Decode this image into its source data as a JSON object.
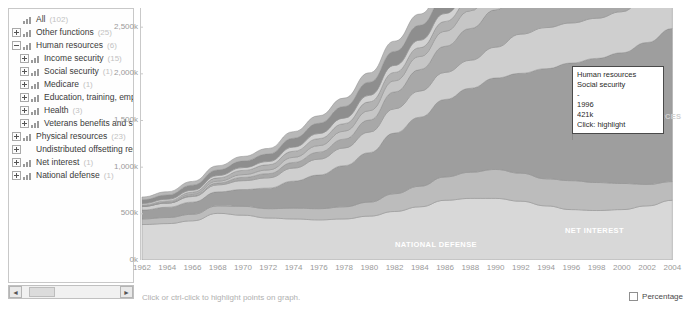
{
  "sidebar": {
    "items": [
      {
        "label": "All",
        "count": "(102)",
        "indent": 0,
        "expander": "none",
        "icon": "bar-chart-icon"
      },
      {
        "label": "Other functions",
        "count": "(25)",
        "indent": 0,
        "expander": "plus",
        "icon": "bar-chart-icon"
      },
      {
        "label": "Human resources",
        "count": "(6)",
        "indent": 0,
        "expander": "minus",
        "icon": "bar-chart-icon"
      },
      {
        "label": "Income security",
        "count": "(15)",
        "indent": 1,
        "expander": "plus",
        "icon": "bar-chart-icon"
      },
      {
        "label": "Social security",
        "count": "(1)",
        "indent": 1,
        "expander": "plus",
        "icon": "bar-chart-icon"
      },
      {
        "label": "Medicare",
        "count": "(1)",
        "indent": 1,
        "expander": "plus",
        "icon": "bar-chart-icon"
      },
      {
        "label": "Education, training, emp",
        "count": "",
        "indent": 1,
        "expander": "plus",
        "icon": "bar-chart-icon"
      },
      {
        "label": "Health",
        "count": "(3)",
        "indent": 1,
        "expander": "plus",
        "icon": "bar-chart-icon"
      },
      {
        "label": "Veterans benefits and s",
        "count": "",
        "indent": 1,
        "expander": "plus",
        "icon": "bar-chart-icon"
      },
      {
        "label": "Physical resources",
        "count": "(23)",
        "indent": 0,
        "expander": "plus",
        "icon": "bar-chart-icon"
      },
      {
        "label": "Undistributed offsetting rec",
        "count": "",
        "indent": 0,
        "expander": "plus",
        "icon": "none"
      },
      {
        "label": "Net interest",
        "count": "(1)",
        "indent": 0,
        "expander": "plus",
        "icon": "bar-chart-icon"
      },
      {
        "label": "National defense",
        "count": "(1)",
        "indent": 0,
        "expander": "plus",
        "icon": "bar-chart-icon"
      }
    ],
    "scroll": {
      "left_arrow": "◄",
      "right_arrow": "►"
    }
  },
  "tooltip": {
    "line1": "Human resources",
    "line2": "Social security",
    "line3": "-",
    "line4": "1996",
    "line5": "421k",
    "line6": "Click: highlight"
  },
  "footer": {
    "hint": "Click or ctrl-click to highlight points on graph.",
    "percentage_label": "Percentage"
  },
  "area_labels": {
    "national_defense": "NATIONAL DEFENSE",
    "net_interest": "NET INTEREST",
    "human_resources": "HUMAN RESOURCES"
  },
  "chart_data": {
    "type": "area",
    "title": "",
    "xlabel": "",
    "ylabel": "",
    "grid": false,
    "legend_position": "in-chart",
    "xlim": [
      1962,
      2005
    ],
    "ylim": [
      0,
      2700
    ],
    "y_unit": "k",
    "yticks": [
      0,
      500,
      1000,
      1500,
      2000,
      2500
    ],
    "ytick_labels": [
      "0k",
      "500k",
      "1,000k",
      "1,500k",
      "2,000k",
      "2,500k"
    ],
    "x": [
      1962,
      1964,
      1966,
      1968,
      1970,
      1972,
      1974,
      1976,
      1978,
      1980,
      1982,
      1984,
      1986,
      1988,
      1990,
      1992,
      1994,
      1996,
      1998,
      2000,
      2002,
      2004
    ],
    "xtick_labels": [
      "1962",
      "1964",
      "1966",
      "1968",
      "1970",
      "1972",
      "1974",
      "1976",
      "1978",
      "1980",
      "1982",
      "1984",
      "1986",
      "1988",
      "1990",
      "1992",
      "1994",
      "1996",
      "1998",
      "2000",
      "2002",
      "2004"
    ],
    "stacked": true,
    "series": [
      {
        "name": "National defense",
        "color": "#d8d8d8",
        "values": [
          380,
          390,
          420,
          500,
          480,
          450,
          440,
          430,
          440,
          470,
          520,
          570,
          640,
          660,
          660,
          630,
          580,
          540,
          530,
          540,
          580,
          640
        ]
      },
      {
        "name": "Net interest",
        "color": "#bcbcbc",
        "values": [
          60,
          65,
          70,
          80,
          95,
          100,
          115,
          120,
          130,
          150,
          190,
          220,
          250,
          280,
          310,
          300,
          290,
          310,
          300,
          280,
          230,
          200
        ]
      },
      {
        "name": "Human resources",
        "sublayers": [
          {
            "name": "Social security",
            "color": "#9e9e9e",
            "values": [
              95,
              110,
              130,
              150,
              180,
              220,
              290,
              360,
              440,
              530,
              650,
              740,
              830,
              900,
              980,
              1070,
              1180,
              1260,
              1330,
              1400,
              1520,
              1640
            ]
          },
          {
            "name": "Income security",
            "color": "#cfcfcf",
            "values": [
              40,
              45,
              60,
              75,
              95,
              110,
              140,
              170,
              190,
              220,
              260,
              280,
              290,
              300,
              330,
              420,
              440,
              430,
              430,
              440,
              510,
              560
            ]
          },
          {
            "name": "Medicare",
            "color": "#a8a8a8",
            "values": [
              0,
              0,
              10,
              20,
              35,
              45,
              60,
              75,
              95,
              130,
              180,
              230,
              280,
              340,
              400,
              480,
              560,
              600,
              620,
              680,
              760,
              840
            ]
          },
          {
            "name": "Health",
            "color": "#c6c6c6",
            "values": [
              5,
              8,
              12,
              20,
              30,
              40,
              55,
              70,
              85,
              100,
              120,
              140,
              160,
              190,
              230,
              290,
              330,
              360,
              380,
              430,
              500,
              570
            ]
          },
          {
            "name": "Education, training, employment",
            "color": "#b2b2b2",
            "values": [
              10,
              15,
              25,
              35,
              45,
              55,
              65,
              75,
              80,
              95,
              90,
              95,
              105,
              115,
              130,
              150,
              160,
              170,
              180,
              200,
              230,
              260
            ]
          },
          {
            "name": "Veterans benefits and services",
            "color": "#d2d2d2",
            "values": [
              15,
              18,
              20,
              25,
              30,
              35,
              45,
              55,
              60,
              70,
              75,
              80,
              85,
              90,
              95,
              105,
              110,
              115,
              120,
              125,
              135,
              145
            ]
          }
        ]
      },
      {
        "name": "Physical resources",
        "color": "#8e8e8e",
        "values": [
          40,
          45,
          55,
          60,
          70,
          80,
          95,
          110,
          125,
          140,
          150,
          160,
          170,
          180,
          190,
          200,
          210,
          215,
          220,
          230,
          250,
          270
        ]
      },
      {
        "name": "Other functions",
        "color": "#b8b8b8",
        "values": [
          30,
          35,
          40,
          45,
          50,
          60,
          70,
          80,
          90,
          100,
          110,
          120,
          125,
          130,
          140,
          150,
          155,
          160,
          165,
          175,
          190,
          210
        ]
      }
    ],
    "highlight_point": {
      "series": "Social security",
      "x": 1996,
      "y": 421,
      "label": "421k"
    }
  }
}
